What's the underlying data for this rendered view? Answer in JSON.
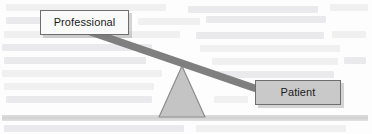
{
  "figure": {
    "type": "seesaw-balance-diagram",
    "colors": {
      "beam": "#7f7f7f",
      "fulcrum_fill": "#c4c4c4",
      "fulcrum_stroke": "#8c8c8c",
      "ground": "#d2d2d2",
      "patient_box_fill": "#c9c9c9",
      "professional_box_fill": "#fafafa",
      "box_border": "#6e6e6e",
      "text": "#1b1b1b",
      "background": "#fdfdfd",
      "bleed_text": "#ececed"
    }
  },
  "labels": {
    "professional": "Professional",
    "patient": "Patient"
  },
  "geometry": {
    "beam": {
      "x1": 88,
      "y1": 31,
      "x2": 260,
      "y2": 90,
      "thickness": 7
    },
    "fulcrum": {
      "apex_x": 182,
      "apex_y": 65,
      "base_left_x": 159,
      "base_right_x": 205,
      "base_y": 118
    },
    "ground": {
      "x": 2,
      "y": 115,
      "width": 366,
      "height": 6
    },
    "professional_box": {
      "x": 40,
      "y": 10,
      "width": 89,
      "height": 25
    },
    "patient_box": {
      "x": 255,
      "y": 80,
      "width": 86,
      "height": 25
    }
  },
  "bleed_lines": [
    {
      "x": 6,
      "y": 4,
      "w": 160
    },
    {
      "x": 188,
      "y": 6,
      "w": 130
    },
    {
      "x": 330,
      "y": 4,
      "w": 38
    },
    {
      "x": 6,
      "y": 17,
      "w": 118
    },
    {
      "x": 138,
      "y": 18,
      "w": 62
    },
    {
      "x": 206,
      "y": 16,
      "w": 120
    },
    {
      "x": 4,
      "y": 31,
      "w": 176
    },
    {
      "x": 196,
      "y": 32,
      "w": 128
    },
    {
      "x": 332,
      "y": 31,
      "w": 34
    },
    {
      "x": 2,
      "y": 44,
      "w": 150
    },
    {
      "x": 200,
      "y": 45,
      "w": 140
    },
    {
      "x": 4,
      "y": 57,
      "w": 142
    },
    {
      "x": 212,
      "y": 58,
      "w": 126
    },
    {
      "x": 344,
      "y": 57,
      "w": 22
    },
    {
      "x": 2,
      "y": 70,
      "w": 160
    },
    {
      "x": 214,
      "y": 71,
      "w": 120
    },
    {
      "x": 4,
      "y": 83,
      "w": 150
    },
    {
      "x": 6,
      "y": 96,
      "w": 146
    },
    {
      "x": 214,
      "y": 96,
      "w": 34
    },
    {
      "x": 4,
      "y": 125,
      "w": 180
    },
    {
      "x": 196,
      "y": 125,
      "w": 150
    }
  ]
}
